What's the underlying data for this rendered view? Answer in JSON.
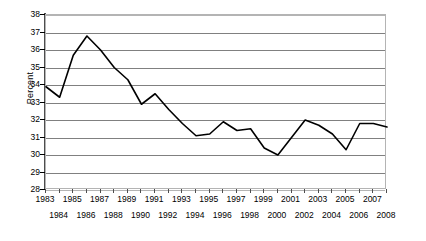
{
  "chart_data": {
    "type": "line",
    "title": "",
    "subtitle": "",
    "xlabel": "",
    "ylabel": "Percent",
    "ylim": [
      28,
      38
    ],
    "xlim": [
      1983,
      2008
    ],
    "ytick_step": 1,
    "grid": true,
    "grid_axis": "y",
    "legend": false,
    "legend_position": "none",
    "line_color": "#000000",
    "grid_color": "#808080",
    "plot_border_color": "#b4b4b4",
    "y_ticks": [
      38,
      37,
      36,
      35,
      34,
      33,
      32,
      31,
      30,
      29,
      28
    ],
    "x_ticks": [
      1983,
      1984,
      1985,
      1986,
      1987,
      1988,
      1989,
      1990,
      1991,
      1992,
      1993,
      1994,
      1995,
      1996,
      1997,
      1998,
      1999,
      2000,
      2001,
      2002,
      2003,
      2004,
      2005,
      2006,
      2007,
      2008
    ],
    "x_tick_label_rows": [
      "top",
      "bottom",
      "top",
      "bottom",
      "top",
      "bottom",
      "top",
      "bottom",
      "top",
      "bottom",
      "top",
      "bottom",
      "top",
      "bottom",
      "top",
      "bottom",
      "top",
      "bottom",
      "top",
      "bottom",
      "top",
      "bottom",
      "top",
      "bottom",
      "top",
      "bottom"
    ],
    "categories": [
      1983,
      1984,
      1985,
      1986,
      1987,
      1988,
      1989,
      1990,
      1991,
      1992,
      1993,
      1994,
      1995,
      1996,
      1997,
      1998,
      1999,
      2000,
      2001,
      2002,
      2003,
      2004,
      2005,
      2006,
      2007,
      2008
    ],
    "values": [
      33.9,
      33.3,
      35.7,
      36.8,
      36.0,
      35.0,
      34.3,
      32.9,
      33.5,
      32.6,
      31.8,
      31.1,
      31.2,
      31.9,
      31.4,
      31.5,
      30.4,
      30.0,
      31.0,
      32.0,
      31.7,
      31.2,
      30.3,
      31.8,
      31.8,
      31.6
    ],
    "series": [
      {
        "name": "Percent",
        "values": [
          33.9,
          33.3,
          35.7,
          36.8,
          36.0,
          35.0,
          34.3,
          32.9,
          33.5,
          32.6,
          31.8,
          31.1,
          31.2,
          31.9,
          31.4,
          31.5,
          30.4,
          30.0,
          31.0,
          32.0,
          31.7,
          31.2,
          30.3,
          31.8,
          31.8,
          31.6
        ]
      }
    ],
    "max_point": {
      "x": 1986,
      "y": 36.8
    },
    "min_point": {
      "x": 2000,
      "y": 30.0
    }
  }
}
